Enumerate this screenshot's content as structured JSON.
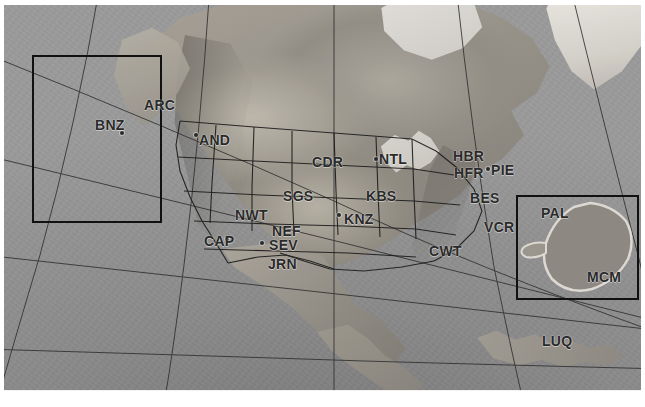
{
  "map": {
    "type": "relief-basemap",
    "projection": "conic",
    "grayscale": true,
    "accent_color": "#2a2a2a",
    "frame_color": "#111111",
    "background_color": "#8e8e8e"
  },
  "insets": [
    {
      "name": "alaska-inset",
      "label": ""
    },
    {
      "name": "antarctica-inset",
      "label": ""
    }
  ],
  "sites": [
    {
      "code": "ARC",
      "x": 140,
      "y": 93,
      "dot": false
    },
    {
      "code": "BNZ",
      "x": 91,
      "y": 113,
      "dot": true,
      "dot_x": 116,
      "dot_y": 126
    },
    {
      "code": "AND",
      "x": 195,
      "y": 128,
      "dot": true,
      "dot_x": 190,
      "dot_y": 128
    },
    {
      "code": "CDR",
      "x": 308,
      "y": 150,
      "dot": false
    },
    {
      "code": "NTL",
      "x": 375,
      "y": 147,
      "dot": true,
      "dot_x": 370,
      "dot_y": 152
    },
    {
      "code": "HBR",
      "x": 449,
      "y": 144,
      "dot": false
    },
    {
      "code": "HFR",
      "x": 450,
      "y": 161,
      "dot": false
    },
    {
      "code": "PIE",
      "x": 487,
      "y": 158,
      "dot": true,
      "dot_x": 482,
      "dot_y": 162
    },
    {
      "code": "SGS",
      "x": 279,
      "y": 184,
      "dot": false
    },
    {
      "code": "KBS",
      "x": 362,
      "y": 184,
      "dot": false
    },
    {
      "code": "BES",
      "x": 466,
      "y": 186,
      "dot": false
    },
    {
      "code": "NWT",
      "x": 231,
      "y": 203,
      "dot": false
    },
    {
      "code": "KNZ",
      "x": 340,
      "y": 207,
      "dot": true,
      "dot_x": 333,
      "dot_y": 208
    },
    {
      "code": "VCR",
      "x": 480,
      "y": 215,
      "dot": false
    },
    {
      "code": "PAL",
      "x": 537,
      "y": 201,
      "dot": false
    },
    {
      "code": "CAP",
      "x": 200,
      "y": 229,
      "dot": true,
      "dot_x": 221,
      "dot_y": 232
    },
    {
      "code": "NEF",
      "x": 268,
      "y": 219,
      "dot": false
    },
    {
      "code": "SEV",
      "x": 265,
      "y": 233,
      "dot": true,
      "dot_x": 256,
      "dot_y": 236
    },
    {
      "code": "JRN",
      "x": 264,
      "y": 252,
      "dot": false
    },
    {
      "code": "CWT",
      "x": 425,
      "y": 239,
      "dot": false
    },
    {
      "code": "MCM",
      "x": 583,
      "y": 265,
      "dot": false
    },
    {
      "code": "LUQ",
      "x": 538,
      "y": 329,
      "dot": false
    }
  ]
}
